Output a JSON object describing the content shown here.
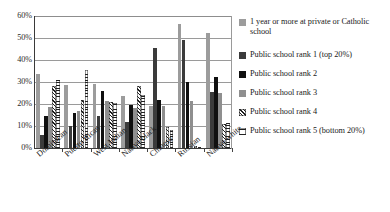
{
  "chart_data": {
    "type": "bar",
    "title": "",
    "subtitle": "",
    "xlabel": "",
    "ylabel": "",
    "ylim": [
      0,
      60
    ],
    "ytick_labels": [
      "0%",
      "10%",
      "20%",
      "30%",
      "40%",
      "50%",
      "60%"
    ],
    "ytick_values": [
      0,
      10,
      20,
      30,
      40,
      50,
      60
    ],
    "grid": true,
    "legend_position": "right",
    "categories": [
      "Dominican",
      "Puerto Rican",
      "West Indian",
      "Native black",
      "Chinese",
      "Russian",
      "Native white"
    ],
    "series": [
      {
        "name": "1 year or more at private or Catholic school",
        "color": "#9c9c9c",
        "pattern": "solid",
        "values": [
          33.5,
          28.5,
          29.0,
          23.5,
          19.0,
          56.5,
          52.5
        ]
      },
      {
        "name": "Public school rank 1 (top 20%)",
        "color": "#3b3b3b",
        "pattern": "solid",
        "values": [
          6.0,
          10.0,
          14.5,
          12.0,
          45.5,
          49.0,
          25.5
        ]
      },
      {
        "name": "Public school rank 2",
        "color": "#101010",
        "pattern": "solid",
        "values": [
          14.5,
          16.0,
          26.0,
          19.5,
          22.0,
          30.0,
          32.5
        ]
      },
      {
        "name": "Public school rank 3",
        "color": "#8f8f8f",
        "pattern": "solid",
        "values": [
          18.5,
          17.0,
          21.5,
          18.0,
          19.0,
          21.5,
          25.0
        ]
      },
      {
        "name": "Public school rank 4",
        "color": "#1d1d1d",
        "pattern": "diagonal-hatch",
        "values": [
          28.0,
          22.0,
          21.0,
          28.0,
          9.5,
          1.0,
          11.0
        ]
      },
      {
        "name": "Public school rank 5 (bottom 20%)",
        "color": "#1d1d1d",
        "pattern": "horizontal-lines",
        "values": [
          31.0,
          35.5,
          20.5,
          24.0,
          8.0,
          0.5,
          11.5
        ]
      }
    ]
  },
  "legend": {
    "items": [
      "1 year or more at private or Catholic school",
      "Public school rank 1 (top 20%)",
      "Public school rank 2",
      "Public school rank 3",
      "Public school rank 4",
      "Public school rank 5 (bottom 20%)"
    ]
  }
}
